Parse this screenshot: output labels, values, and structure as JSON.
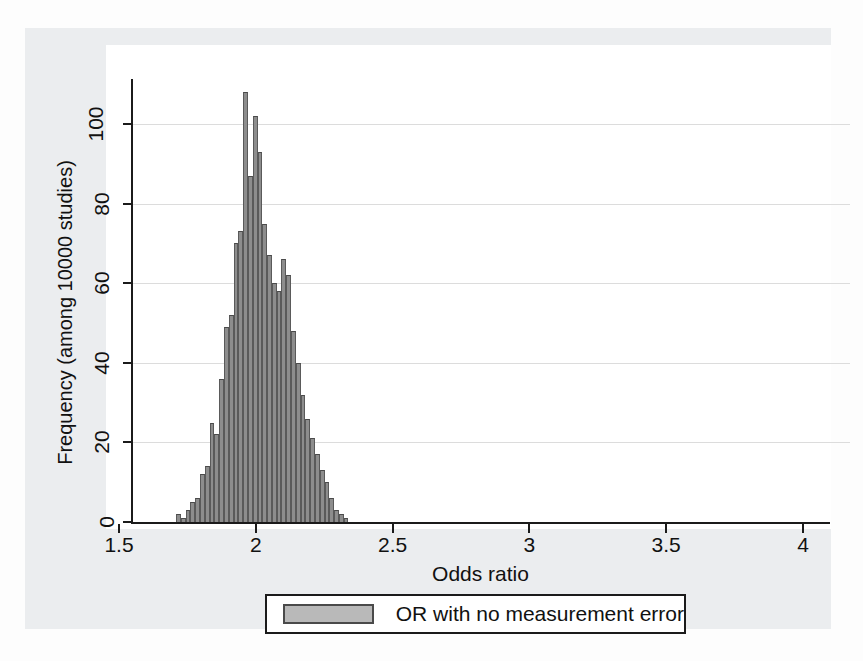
{
  "chart_data": {
    "type": "bar",
    "title": "",
    "subtitle": "",
    "xlabel": "Odds ratio",
    "ylabel": "Frequency (among 10000 studies)",
    "xlim": [
      1.5,
      4
    ],
    "ylim": [
      0,
      110
    ],
    "xticks": [
      "1.5",
      "2",
      "2.5",
      "3",
      "3.5",
      "4"
    ],
    "xtick_values": [
      1.5,
      2,
      2.5,
      3,
      3.5,
      4
    ],
    "yticks": [
      "0",
      "20",
      "40",
      "60",
      "80",
      "100"
    ],
    "ytick_values": [
      0,
      20,
      40,
      60,
      80,
      100
    ],
    "grid": "horizontal",
    "legend_position": "below-axes",
    "legend": [
      {
        "label": "OR with no measurement error",
        "color": "#b9b9b9"
      }
    ],
    "bar_color": "#8d8d8d",
    "bar_edge_color": "#4a4a4a",
    "bin_width": 0.0175,
    "series": [
      {
        "name": "OR with no measurement error",
        "x": [
          1.7175,
          1.735,
          1.7525,
          1.77,
          1.7875,
          1.805,
          1.8225,
          1.84,
          1.8575,
          1.875,
          1.8925,
          1.91,
          1.9275,
          1.945,
          1.9625,
          1.98,
          1.9975,
          2.015,
          2.0325,
          2.05,
          2.0675,
          2.085,
          2.1025,
          2.12,
          2.1375,
          2.155,
          2.1725,
          2.19,
          2.2075,
          2.225,
          2.2425,
          2.26,
          2.2775,
          2.295,
          2.3125,
          2.33
        ],
        "values": [
          2,
          1,
          3,
          5,
          6,
          12,
          14,
          25,
          22,
          36,
          49,
          52,
          70,
          73,
          108,
          87,
          102,
          93,
          75,
          67,
          60,
          58,
          66,
          62,
          48,
          40,
          32,
          26,
          21,
          17,
          13,
          10,
          6,
          3,
          2,
          1
        ]
      }
    ]
  },
  "axis": {
    "x_title": "Odds ratio",
    "y_title": "Frequency (among 10000 studies)"
  },
  "legend": {
    "entry_label": "OR with no measurement error"
  }
}
